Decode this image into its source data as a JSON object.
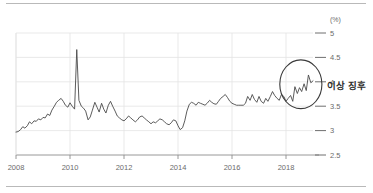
{
  "chart_data": {
    "type": "line",
    "title": "",
    "xlabel": "",
    "ylabel": "",
    "unit_label": "(%)",
    "xlim": [
      2008.0,
      2019.0
    ],
    "ylim": [
      2.5,
      5.0
    ],
    "grid": true,
    "legend": null,
    "x_ticks": [
      "2008",
      "2010",
      "2012",
      "2014",
      "2016",
      "2018"
    ],
    "x_tick_values": [
      2008,
      2010,
      2012,
      2014,
      2016,
      2018
    ],
    "y_ticks": [
      "2.5",
      "3",
      "3.5",
      "4",
      "4.5",
      "5"
    ],
    "y_tick_values": [
      2.5,
      3,
      3.5,
      4,
      4.5,
      5
    ],
    "annotations": [
      {
        "type": "ellipse",
        "label": "이상 징후",
        "center_x": 2018.55,
        "center_y": 3.95,
        "radius_x": 0.78,
        "radius_y": 0.5
      }
    ],
    "series": [
      {
        "name": "rate",
        "x": [
          2008.0,
          2008.08,
          2008.17,
          2008.25,
          2008.33,
          2008.42,
          2008.5,
          2008.58,
          2008.67,
          2008.75,
          2008.83,
          2008.92,
          2009.0,
          2009.08,
          2009.17,
          2009.25,
          2009.33,
          2009.42,
          2009.5,
          2009.58,
          2009.67,
          2009.75,
          2009.83,
          2009.92,
          2010.0,
          2010.08,
          2010.17,
          2010.25,
          2010.33,
          2010.42,
          2010.5,
          2010.58,
          2010.67,
          2010.75,
          2010.83,
          2010.92,
          2011.0,
          2011.08,
          2011.17,
          2011.25,
          2011.33,
          2011.42,
          2011.5,
          2011.58,
          2011.67,
          2011.75,
          2011.83,
          2011.92,
          2012.0,
          2012.08,
          2012.17,
          2012.25,
          2012.33,
          2012.42,
          2012.5,
          2012.58,
          2012.67,
          2012.75,
          2012.83,
          2012.92,
          2013.0,
          2013.08,
          2013.17,
          2013.25,
          2013.33,
          2013.42,
          2013.5,
          2013.58,
          2013.67,
          2013.75,
          2013.83,
          2013.92,
          2014.0,
          2014.08,
          2014.17,
          2014.25,
          2014.33,
          2014.42,
          2014.5,
          2014.58,
          2014.67,
          2014.75,
          2014.83,
          2014.92,
          2015.0,
          2015.08,
          2015.17,
          2015.25,
          2015.33,
          2015.42,
          2015.5,
          2015.58,
          2015.67,
          2015.75,
          2015.83,
          2015.92,
          2016.0,
          2016.08,
          2016.17,
          2016.25,
          2016.33,
          2016.42,
          2016.5,
          2016.58,
          2016.67,
          2016.75,
          2016.83,
          2016.92,
          2017.0,
          2017.08,
          2017.17,
          2017.25,
          2017.33,
          2017.42,
          2017.5,
          2017.58,
          2017.67,
          2017.75,
          2017.83,
          2017.92,
          2018.0,
          2018.08,
          2018.17,
          2018.25,
          2018.33,
          2018.42,
          2018.5,
          2018.58,
          2018.67,
          2018.75,
          2018.83,
          2018.92,
          2019.0
        ],
        "values": [
          2.97,
          2.98,
          3.02,
          3.08,
          3.05,
          3.1,
          3.18,
          3.14,
          3.2,
          3.19,
          3.24,
          3.22,
          3.27,
          3.26,
          3.34,
          3.31,
          3.42,
          3.5,
          3.58,
          3.62,
          3.66,
          3.6,
          3.52,
          3.48,
          3.57,
          3.5,
          3.44,
          4.66,
          3.62,
          3.5,
          3.46,
          3.4,
          3.22,
          3.28,
          3.42,
          3.58,
          3.48,
          3.38,
          3.56,
          3.44,
          3.36,
          3.52,
          3.6,
          3.5,
          3.4,
          3.3,
          3.26,
          3.22,
          3.2,
          3.24,
          3.3,
          3.26,
          3.22,
          3.18,
          3.22,
          3.28,
          3.3,
          3.26,
          3.22,
          3.18,
          3.14,
          3.18,
          3.16,
          3.2,
          3.24,
          3.22,
          3.18,
          3.14,
          3.12,
          3.16,
          3.22,
          3.2,
          3.1,
          3.02,
          3.06,
          3.2,
          3.4,
          3.54,
          3.58,
          3.56,
          3.52,
          3.58,
          3.56,
          3.54,
          3.52,
          3.56,
          3.62,
          3.58,
          3.55,
          3.54,
          3.6,
          3.66,
          3.7,
          3.74,
          3.68,
          3.6,
          3.56,
          3.54,
          3.52,
          3.52,
          3.52,
          3.52,
          3.56,
          3.7,
          3.62,
          3.74,
          3.64,
          3.58,
          3.7,
          3.6,
          3.56,
          3.66,
          3.6,
          3.7,
          3.8,
          3.72,
          3.66,
          3.62,
          3.74,
          3.7,
          3.6,
          3.66,
          3.72,
          3.6,
          3.9,
          3.76,
          3.88,
          3.8,
          3.96,
          3.82,
          4.14,
          3.98,
          4.02
        ]
      }
    ]
  }
}
